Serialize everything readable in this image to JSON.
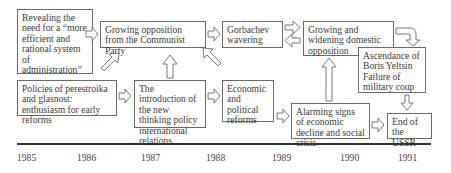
{
  "diagram": {
    "boxes": {
      "revealing": "Revealing the need for a “more efficient and rational system of administration”",
      "growing_opposition_party": "Growing opposition from the Communist Party",
      "gorbachev": "Gorbachev wavering",
      "domestic_opposition": "Growing and widening domestic opposition",
      "yeltsin": "Ascendance of Boris Yeltsin Failure of military coup",
      "perestroika": "Policies of perestroika and glasnost: enthusiasm for early reforms",
      "new_thinking": "The introduction of the new thinking policy international relations",
      "reforms": "Economic and political reforms",
      "alarming": "Alarming signs of economic decline and social crisis",
      "end_ussr": "End of the USSR"
    },
    "timeline": {
      "years": [
        "1985",
        "1986",
        "1987",
        "1988",
        "1989",
        "1990",
        "1991"
      ]
    },
    "colors": {
      "border": "#6a6a6a",
      "text": "#3a3a3a",
      "axis": "#333333"
    }
  }
}
